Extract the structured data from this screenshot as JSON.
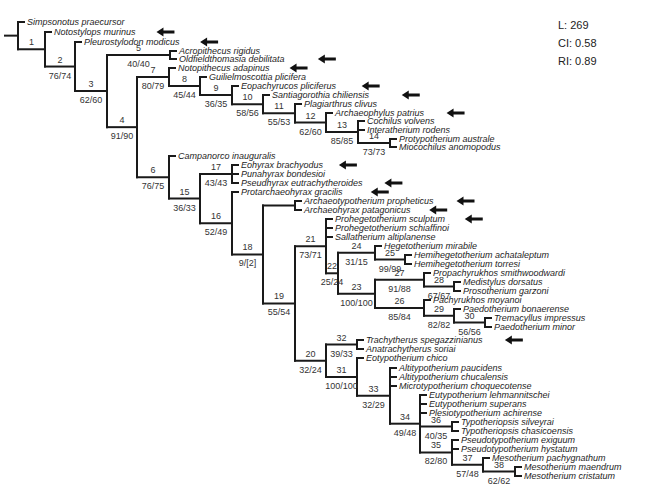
{
  "stats": {
    "tree_length": "L: 269",
    "ci": "CI: 0.58",
    "ri": "RI: 0.89"
  },
  "tips": [
    {
      "name": "Simpsonotus praecursor",
      "y": 22,
      "arrow": false
    },
    {
      "name": "Notostylops murinus",
      "y": 32,
      "arrow": true
    },
    {
      "name": "Pleurostylodon modicus",
      "y": 42,
      "arrow": true
    },
    {
      "name": "Acropithecus rigidus",
      "y": 51,
      "arrow": false
    },
    {
      "name": "Oldfieldthomasia debilitata",
      "y": 59,
      "arrow": true
    },
    {
      "name": "Notopithecus adapinus",
      "y": 68,
      "arrow": true
    },
    {
      "name": "Guilielmoscottia plicifera",
      "y": 77,
      "arrow": false
    },
    {
      "name": "Eopachyrucos pliciferus",
      "y": 86,
      "arrow": true
    },
    {
      "name": "Santiagorothia chiliensis",
      "y": 95,
      "arrow": true
    },
    {
      "name": "Plagiarthrus clivus",
      "y": 104,
      "arrow": false
    },
    {
      "name": "Archaeophylus patrius",
      "y": 113,
      "arrow": true
    },
    {
      "name": "Cochilus volvens",
      "y": 121,
      "arrow": false
    },
    {
      "name": "Interatherium rodens",
      "y": 130,
      "arrow": false
    },
    {
      "name": "Protypotherium australe",
      "y": 139,
      "arrow": false
    },
    {
      "name": "Miocochilus anomopodus",
      "y": 147,
      "arrow": false
    },
    {
      "name": "Campanorco inauguralis",
      "y": 156,
      "arrow": false
    },
    {
      "name": "Eohyrax brachyodus",
      "y": 165,
      "arrow": true
    },
    {
      "name": "Punahyrax bondesioi",
      "y": 174,
      "arrow": false
    },
    {
      "name": "Pseudhyrax eutrachytheroides",
      "y": 183,
      "arrow": true
    },
    {
      "name": "Protarchaeohyrax gracilis",
      "y": 192,
      "arrow": true
    },
    {
      "name": "Archaeotypotherium propheticus",
      "y": 201,
      "arrow": true
    },
    {
      "name": "Archaeohyrax patagonicus",
      "y": 210,
      "arrow": true
    },
    {
      "name": "Prohegetotherium sculptum",
      "y": 219,
      "arrow": true
    },
    {
      "name": "Prohegetotherium schiaffinoi",
      "y": 228,
      "arrow": false
    },
    {
      "name": "Sallatherium altiplanense",
      "y": 237,
      "arrow": false
    },
    {
      "name": "Hegetotherium mirabile",
      "y": 246,
      "arrow": false
    },
    {
      "name": "Hemihegetotherium achataleptum",
      "y": 255,
      "arrow": false
    },
    {
      "name": "Hemihegetotherium torresi",
      "y": 264,
      "arrow": false
    },
    {
      "name": "Propachyrukhos smithwoodwardi",
      "y": 273,
      "arrow": false
    },
    {
      "name": "Medistylus dorsatus",
      "y": 282,
      "arrow": false
    },
    {
      "name": "Prosotherium garzoni",
      "y": 291,
      "arrow": false
    },
    {
      "name": "Pachyrukhos moyanoi",
      "y": 300,
      "arrow": false
    },
    {
      "name": "Paedotherium bonaerense",
      "y": 309,
      "arrow": false
    },
    {
      "name": "Tremacyllus impressus",
      "y": 318,
      "arrow": false
    },
    {
      "name": "Paedotherium minor",
      "y": 327,
      "arrow": false
    },
    {
      "name": "Trachytherus spegazzinianus",
      "y": 340,
      "arrow": true
    },
    {
      "name": "Anatrachytherus soriai",
      "y": 349,
      "arrow": false
    },
    {
      "name": "Eotypotherium chico",
      "y": 358,
      "arrow": false
    },
    {
      "name": "Altitypotherium paucidens",
      "y": 368,
      "arrow": false
    },
    {
      "name": "Altitypotherium chucalensis",
      "y": 377,
      "arrow": false
    },
    {
      "name": "Microtypotherium choquecotense",
      "y": 386,
      "arrow": false
    },
    {
      "name": "Eutypotherium lehmannitschei",
      "y": 395,
      "arrow": false
    },
    {
      "name": "Eutypotherium superans",
      "y": 404,
      "arrow": false
    },
    {
      "name": "Plesiotypotherium achirense",
      "y": 413,
      "arrow": false
    },
    {
      "name": "Typotheriopsis silveyrai",
      "y": 422,
      "arrow": false
    },
    {
      "name": "Typotheriopsis chasicoensis",
      "y": 431,
      "arrow": false
    },
    {
      "name": "Pseudotypotherium exiguum",
      "y": 440,
      "arrow": false
    },
    {
      "name": "Pseudotypotherium hystatum",
      "y": 449,
      "arrow": false
    },
    {
      "name": "Mesotherium pachygnathum",
      "y": 458,
      "arrow": false
    },
    {
      "name": "Mesotherium maendrum",
      "y": 467,
      "arrow": false
    },
    {
      "name": "Mesotherium cristatum",
      "y": 476,
      "arrow": false
    }
  ],
  "nodes": [
    {
      "id": "1",
      "support": ""
    },
    {
      "id": "2",
      "support": "76/74"
    },
    {
      "id": "3",
      "support": "62/60"
    },
    {
      "id": "4",
      "support": "91/90"
    },
    {
      "id": "5",
      "support": "40/40"
    },
    {
      "id": "6",
      "support": "76/75"
    },
    {
      "id": "7",
      "support": "80/79"
    },
    {
      "id": "8",
      "support": "45/44"
    },
    {
      "id": "9",
      "support": "36/35"
    },
    {
      "id": "10",
      "support": "58/56"
    },
    {
      "id": "11",
      "support": "55/53"
    },
    {
      "id": "12",
      "support": "62/60"
    },
    {
      "id": "13",
      "support": "85/85"
    },
    {
      "id": "14",
      "support": "73/73"
    },
    {
      "id": "15",
      "support": "36/33"
    },
    {
      "id": "16",
      "support": "52/49"
    },
    {
      "id": "17",
      "support": "43/43"
    },
    {
      "id": "18",
      "support": "9/[2]"
    },
    {
      "id": "19",
      "support": "55/54"
    },
    {
      "id": "20",
      "support": "32/24"
    },
    {
      "id": "21",
      "support": "73/71"
    },
    {
      "id": "22",
      "support": "25/24"
    },
    {
      "id": "23",
      "support": "100/100"
    },
    {
      "id": "24",
      "support": "31/15"
    },
    {
      "id": "25",
      "support": "99/99"
    },
    {
      "id": "26",
      "support": "85/84"
    },
    {
      "id": "27",
      "support": "91/88"
    },
    {
      "id": "28",
      "support": "67/67"
    },
    {
      "id": "29",
      "support": "82/82"
    },
    {
      "id": "30",
      "support": "56/56"
    },
    {
      "id": "31",
      "support": "100/100"
    },
    {
      "id": "32",
      "support": "39/33"
    },
    {
      "id": "33",
      "support": "32/29"
    },
    {
      "id": "34",
      "support": "49/48"
    },
    {
      "id": "35",
      "support": "82/80"
    },
    {
      "id": "36",
      "support": "40/35"
    },
    {
      "id": "37",
      "support": "57/48"
    },
    {
      "id": "38",
      "support": "62/62"
    }
  ],
  "colors": {
    "branch": "#1a1a1a",
    "text": "#1e1e1e",
    "arrow": "#111111"
  }
}
